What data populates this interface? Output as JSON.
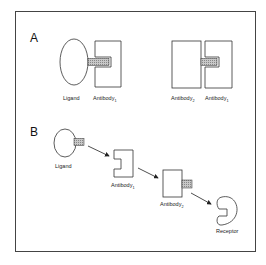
{
  "panels": {
    "A": {
      "label": "A",
      "left_group": {
        "ligand": "Ligand",
        "antibody1": "Antibody",
        "antibody1_sub": "1"
      },
      "right_group": {
        "antibody2": "Antibody",
        "antibody2_sub": "2",
        "antibody1": "Antibody",
        "antibody1_sub": "1"
      }
    },
    "B": {
      "label": "B",
      "ligand": "Ligand",
      "antibody1": "Antibody",
      "antibody1_sub": "1",
      "antibody2": "Antibody",
      "antibody2_sub": "2",
      "receptor": "Receptor"
    }
  },
  "colors": {
    "line": "#333333",
    "hatch": "#999999",
    "background": "#ffffff"
  }
}
